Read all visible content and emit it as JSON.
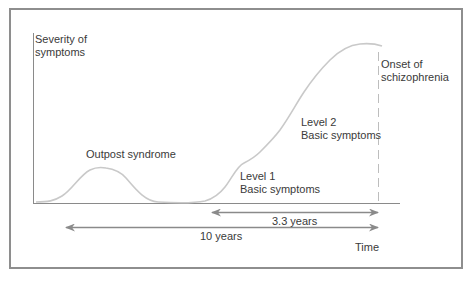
{
  "diagram": {
    "y_axis_label": [
      "Severity of",
      "symptoms"
    ],
    "x_axis_label": "Time",
    "annotations": {
      "outpost": "Outpost syndrome",
      "level1": [
        "Level 1",
        "Basic symptoms"
      ],
      "level2": [
        "Level 2",
        "Basic symptoms"
      ],
      "onset": [
        "Onset of",
        "schizophrenia"
      ]
    },
    "intervals": [
      {
        "label": "3.3 years"
      },
      {
        "label": "10 years"
      }
    ],
    "colors": {
      "frame": "#8e8e8e",
      "axes": "#8a8a8a",
      "curve": "#c9c9c9",
      "arrows": "#8a8a8a",
      "text": "#3a3a3a"
    }
  }
}
